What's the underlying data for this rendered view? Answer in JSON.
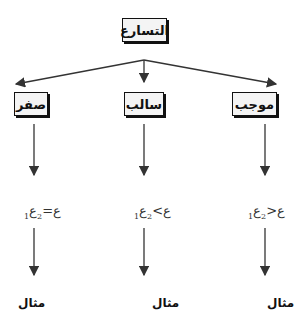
{
  "root": {
    "label": "التسارع"
  },
  "branches": [
    {
      "id": "positive",
      "label": "موجب",
      "relation": {
        "left": "ع",
        "left_sub": "2",
        "op": "<",
        "right": "ع",
        "right_sub": "1"
      },
      "example": "مثال"
    },
    {
      "id": "negative",
      "label": "سالب",
      "relation": {
        "left": "ع",
        "left_sub": "2",
        "op": ">",
        "right": "ع",
        "right_sub": "1"
      },
      "example": "مثال"
    },
    {
      "id": "zero",
      "label": "صفر",
      "relation": {
        "left": "ع",
        "left_sub": "2",
        "op": "=",
        "right": "ع",
        "right_sub": "1"
      },
      "example": "مثال"
    }
  ],
  "colors": {
    "box_fill": "#f4f4f4",
    "stroke": "#111111",
    "arrow": "#333333"
  }
}
